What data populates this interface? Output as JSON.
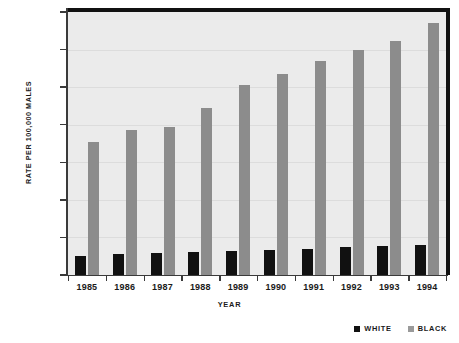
{
  "chart_data": {
    "type": "bar",
    "title": "",
    "xlabel": "Year",
    "ylabel": "Rate per 100,000 Males",
    "categories": [
      "1985",
      "1986",
      "1987",
      "1988",
      "1989",
      "1990",
      "1991",
      "1992",
      "1993",
      "1994"
    ],
    "series": [
      {
        "name": "White",
        "color": "#111111",
        "values": [
          510,
          550,
          575,
          605,
          645,
          670,
          700,
          735,
          760,
          790
        ]
      },
      {
        "name": "Black",
        "color": "#8c8c8c",
        "values": [
          3550,
          3850,
          3930,
          4440,
          5050,
          5350,
          5700,
          6000,
          6230,
          6700
        ]
      }
    ],
    "ylim": [
      0,
      7000
    ],
    "ytick_values": [
      0,
      1000,
      2000,
      3000,
      4000,
      5000,
      6000,
      7000
    ],
    "ytick_labels": [
      "0",
      "1,000",
      "2,000",
      "3,000",
      "4,000",
      "5,000",
      "6,000",
      "7,000"
    ],
    "grid": true,
    "legend_position": "bottom-right",
    "legend": [
      {
        "label": "White",
        "swatch": "white-series"
      },
      {
        "label": "Black",
        "swatch": "black-series"
      }
    ],
    "plot_background": "#ebebeb"
  }
}
